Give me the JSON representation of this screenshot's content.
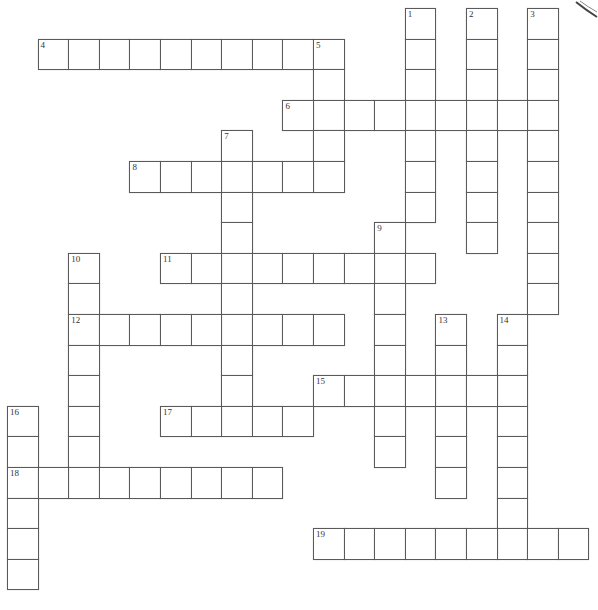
{
  "puzzle": {
    "type": "crossword",
    "line_color": "#5a5a5a",
    "entries": [
      {
        "number": "1",
        "direction": "down",
        "row": 0,
        "col": 13,
        "length": 7
      },
      {
        "number": "2",
        "direction": "down",
        "row": 0,
        "col": 15,
        "length": 8
      },
      {
        "number": "3",
        "direction": "down",
        "row": 0,
        "col": 17,
        "length": 10
      },
      {
        "number": "4",
        "direction": "across",
        "row": 1,
        "col": 1,
        "length": 10
      },
      {
        "number": "5",
        "direction": "down",
        "row": 1,
        "col": 10,
        "length": 5
      },
      {
        "number": "6",
        "direction": "across",
        "row": 3,
        "col": 9,
        "length": 9
      },
      {
        "number": "7",
        "direction": "down",
        "row": 4,
        "col": 7,
        "length": 10
      },
      {
        "number": "8",
        "direction": "across",
        "row": 5,
        "col": 4,
        "length": 7
      },
      {
        "number": "9",
        "direction": "down",
        "row": 7,
        "col": 12,
        "length": 8
      },
      {
        "number": "10",
        "direction": "down",
        "row": 8,
        "col": 2,
        "length": 8
      },
      {
        "number": "11",
        "direction": "across",
        "row": 8,
        "col": 5,
        "length": 9
      },
      {
        "number": "12",
        "direction": "across",
        "row": 10,
        "col": 2,
        "length": 9
      },
      {
        "number": "13",
        "direction": "down",
        "row": 10,
        "col": 14,
        "length": 6
      },
      {
        "number": "14",
        "direction": "down",
        "row": 10,
        "col": 16,
        "length": 8
      },
      {
        "number": "15",
        "direction": "across",
        "row": 12,
        "col": 10,
        "length": 7
      },
      {
        "number": "16",
        "direction": "down",
        "row": 13,
        "col": 0,
        "length": 6
      },
      {
        "number": "17",
        "direction": "across",
        "row": 13,
        "col": 5,
        "length": 5
      },
      {
        "number": "18",
        "direction": "across",
        "row": 15,
        "col": 0,
        "length": 9
      },
      {
        "number": "19",
        "direction": "across",
        "row": 17,
        "col": 10,
        "length": 9
      }
    ]
  },
  "decor": {
    "corner_icon": "page-curl-icon"
  }
}
